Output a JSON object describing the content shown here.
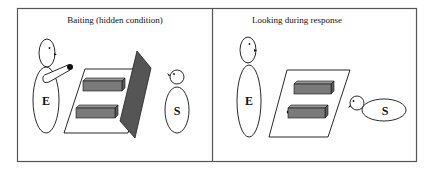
{
  "figure": {
    "panels": [
      {
        "title": "Baiting (hidden condition)",
        "experimenter_label": "E",
        "subject_label": "S",
        "elements": [
          "experimenter",
          "arm-with-bait",
          "platform",
          "two-containers",
          "occluder-screen",
          "subject"
        ]
      },
      {
        "title": "Looking during response",
        "experimenter_label": "E",
        "subject_label": "S",
        "elements": [
          "experimenter",
          "platform",
          "two-containers",
          "subject-leaning"
        ]
      }
    ],
    "colors": {
      "border": "#555555",
      "container_fill": "#7a7a7a",
      "screen_fill": "#555555",
      "line": "#111111"
    }
  }
}
